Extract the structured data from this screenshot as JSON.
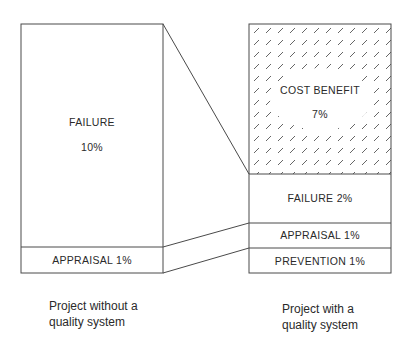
{
  "diagram": {
    "type": "cost-of-quality comparison",
    "left_bar": {
      "caption_line1": "Project without a",
      "caption_line2": "quality system",
      "segments": [
        {
          "label": "FAILURE",
          "value": "10%"
        },
        {
          "label": "APPRAISAL 1%"
        }
      ]
    },
    "right_bar": {
      "caption_line1": "Project with a",
      "caption_line2": "quality system",
      "segments": [
        {
          "label": "COST BENEFIT",
          "value": "7%",
          "hatched": true
        },
        {
          "label": "FAILURE 2%"
        },
        {
          "label": "APPRAISAL 1%"
        },
        {
          "label": "PREVENTION 1%"
        }
      ]
    },
    "colors": {
      "line": "#4a4a4a",
      "hatch": "#555555",
      "background": "#ffffff"
    }
  }
}
